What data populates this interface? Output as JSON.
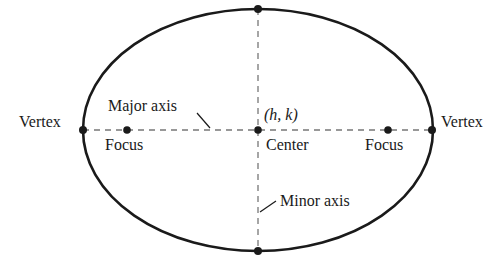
{
  "diagram": {
    "stroke_color": "#1a1a1a",
    "dash_color": "#777777",
    "ellipse": {
      "cx": 258,
      "cy": 130,
      "rx": 175,
      "ry": 121
    },
    "points": {
      "left_vertex": {
        "x": 83,
        "y": 130
      },
      "right_vertex": {
        "x": 432,
        "y": 130
      },
      "left_focus": {
        "x": 127,
        "y": 130
      },
      "right_focus": {
        "x": 388,
        "y": 130
      },
      "center": {
        "x": 258,
        "y": 130
      },
      "top_co_vertex": {
        "x": 258,
        "y": 9
      },
      "bottom_co_vertex": {
        "x": 258,
        "y": 251
      }
    },
    "labels": {
      "left_vertex": "Vertex",
      "right_vertex": "Vertex",
      "left_focus": "Focus",
      "right_focus": "Focus",
      "major_axis": "Major axis",
      "minor_axis": "Minor axis",
      "center": "Center",
      "center_coords": "(h, k)"
    }
  }
}
